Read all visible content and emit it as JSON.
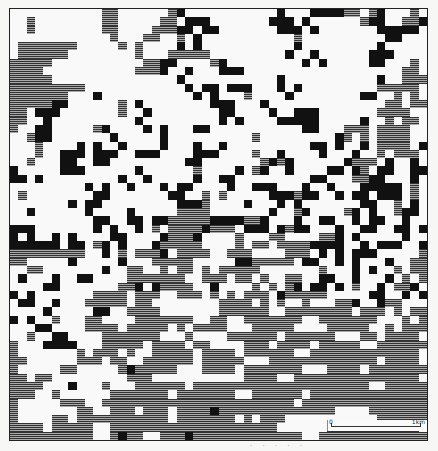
{
  "figure": {
    "type": "raster land-cover map",
    "legend_classes": [
      {
        "key": ".",
        "label": "white",
        "color": "#f9f9f9"
      },
      {
        "key": "#",
        "label": "black",
        "color": "#111111"
      },
      {
        "key": "=",
        "label": "hatched",
        "color": "#666666"
      }
    ],
    "grid_cols": 50,
    "grid_rows": 52,
    "rows": [
      "...........==......=#...........#...####==.=#...=.",
      "..=........==.....==.###.......###.#......=##..==#",
      "..=........==....===##.##.......###.#.......#####.",
      "............=...==..=.#...........=..........##...",
      ".=======.....=.=....#.#...........#.........#.....",
      ".======........=...=====.........#..#......###....",
      "=====...........==##....=#.........#.#.....##...=.",
      "====...........===#..#...###...................==.",
      "=====...............#...........#...........#..===",
      "=========............#.##.###...#.#.........=====.",
      "=======...#...........#.#...=....#........##..=.=.",
      "=====##......=.#........###...#..............==.==",
      "==.###.......=..#........##....#..###.......====..",
      "==..#..........#.........#.#....#####.....#..=.==.",
      "=..##.....=#....#.#...##...........##...===.====..",
      "..=##.......#.....#..........=.........#=.=.====..",
      "...=....#.#..#....#...#..#..........##.#..#.====.#",
      "...=..###.###..###....###....=..#....#...#..=.===.",
      "..=...##..##.........##.......=#=#......#===.#..#.",
      "#.....###......#......=....#.=#..#....##.#=.##..##",
      "##.#.........#..#.....#..##.........##...==##...#.",
      ".........#.#..#...#.##....#..###...#..#...#####.=.",
      ".=........##.......##..=.=.....###=##..#.##.###.=.",
      ".......#.##.........###=....#...#.#.......##..=.#.",
      "..#......#....#.....====.......#..=#....=#.#..=##.",
      "..........##..##.##=====####==#...#..##..#.##..#..",
      "###.......#.#..#.=.====#===.###.#=##...#..##..##.#",
      "#.#..#.#....##....#===#....=...==....==#.#.....#..",
      "######.##.=#.#...#=====....=.==.====####..#.###..#",
      "=========..#.=.===#.====..===....===.#.#.###.....=",
      "==.....#.....#...=====.....##=====.##..#.#...#..==",
      "..==.......#..==..=.==.=.=====.......=...#.#..=.==",
      ".#...#..##....=======..===.==.=..==..##..#...#.=.=",
      "....##.......==#.#====..#....=.=.=#.##.#.=..#.==#.",
      "#.#.......====.===..===.=.=.===.#=====.....##..#.#",
      ".##..#...=====.==........====.=.=..=...==#..#==...",
      "....#.....##..====.......======..========.===.=.==",
      "#.#..=...==....=======..==..=======..=======...=.=",
      "...##....====.=====.=.====...=====....=====..=.===",
      "..=..##....=======...=....======.======...==.====.",
      "=...####...=====.====.==....===.====.=====..======",
      "=.......=.===.=..=====.====.======..=============.",
      "==......===.==..======.=====...=============.====.",
      "=.....==.....=#=====...====.=======...====.=======",
      "==.==.........===...........====..===============.",
      "====...#...=...======.=====================..=====",
      "===..=......=======.=======..======.==============",
      "=.....===..=======================.===============",
      "=.......==..===.===.====#==============....=======",
      "=....==.===========.=======.=.===...........======",
      "====.=====..====================......===========.",
      "==========..=#==..===#=============..============="
    ]
  },
  "scale_bar": {
    "start_label": "0",
    "end_label": "1km"
  },
  "caption_fragment": "· · · · ·"
}
